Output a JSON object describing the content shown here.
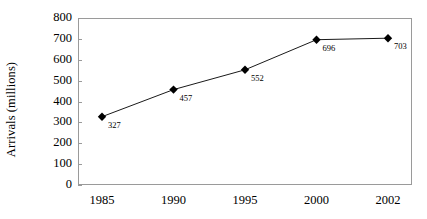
{
  "chart_data": {
    "type": "line",
    "title": "",
    "subtitle": "",
    "xlabel": "",
    "ylabel": "Arrivals (millions)",
    "categories": [
      "1985",
      "1990",
      "1995",
      "2000",
      "2002"
    ],
    "values": [
      327,
      457,
      552,
      696,
      703
    ],
    "point_labels": [
      "327",
      "457",
      "552",
      "696",
      "703"
    ],
    "ylim": [
      0,
      800
    ],
    "y_ticks": [
      "800",
      "700",
      "600",
      "500",
      "400",
      "300",
      "200",
      "100",
      "0"
    ],
    "y_tick_values": [
      800,
      700,
      600,
      500,
      400,
      300,
      200,
      100,
      0
    ],
    "grid": false,
    "legend": "none",
    "marker": "filled-diamond",
    "series_color": "#000000",
    "marker_color": "#000000",
    "axis_color": "#9a9a9a",
    "background_color": "#ffffff",
    "text_color": "#000000"
  }
}
